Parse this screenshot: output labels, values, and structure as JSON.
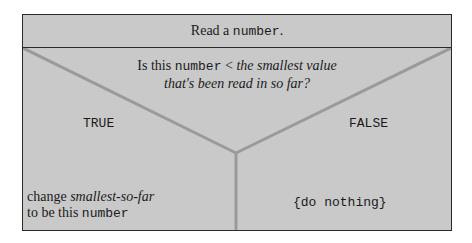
{
  "diagram": {
    "type": "nassi-shneiderman",
    "header": {
      "prefix": "Read a ",
      "code": "number",
      "suffix": "."
    },
    "condition": {
      "line1_prefix": "Is this ",
      "line1_code": "number",
      "line1_op": " < ",
      "line1_italic": "the smallest value",
      "line2_italic": "that's been read in so far?"
    },
    "branches": {
      "true_label": "TRUE",
      "false_label": "FALSE",
      "true_action": {
        "line1_prefix": "change ",
        "line1_italic": "smallest-so-far",
        "line2_prefix": "to be this ",
        "line2_code": "number"
      },
      "false_action": "{do nothing}"
    },
    "colors": {
      "fill": "#c9c9c9",
      "border": "#2a2a2a",
      "lines": "#9a9a9a"
    }
  }
}
